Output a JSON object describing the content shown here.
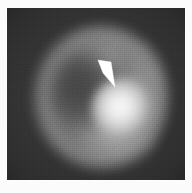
{
  "figure": {
    "kind": "grayscale-scan-image",
    "modality_appearance": "nuclear-medicine-scintigram",
    "background_color": "#363636",
    "paper_color": "#fbfbfb",
    "frame": {
      "left": 7,
      "top": 8,
      "width": 178,
      "height": 172,
      "border_color": "#ffffff"
    },
    "ghost_text": ""
  },
  "scan": {
    "field_label": "",
    "features": [
      {
        "name": "uptake-halo",
        "description": "broad diffuse halo of tracer uptake forming a rounded organ silhouette",
        "center_x": 93,
        "center_y": 89,
        "radius_x": 67,
        "radius_y": 71,
        "peak_gray": "#cdcdcd"
      },
      {
        "name": "uptake-ring",
        "description": "bright crescent rim of activity around the periphery",
        "center_x": 94,
        "center_y": 89,
        "peak_gray": "#cdcdcd"
      },
      {
        "name": "cold-center",
        "description": "darker photopenic interior left of centre",
        "center_x": 77,
        "center_y": 83,
        "peak_gray": "#282828"
      },
      {
        "name": "focal-hotspot",
        "description": "intense focal accumulation indicated by the arrow",
        "center_x": 115,
        "center_y": 101,
        "peak_gray": "#fcfcfc"
      },
      {
        "name": "lower-arc",
        "description": "diffuse activity along the inferior arc",
        "center_x": 105,
        "center_y": 134,
        "peak_gray": "#c8c8c8"
      },
      {
        "name": "upper-arc",
        "description": "activity along the superior rim",
        "center_x": 100,
        "center_y": 44,
        "peak_gray": "#bababa"
      },
      {
        "name": "right-arc",
        "description": "activity along the right lateral rim",
        "center_x": 138,
        "center_y": 88,
        "peak_gray": "#c4c4c4"
      }
    ]
  },
  "annotation": {
    "arrow": {
      "name": "pointer-arrow",
      "color": "#ffffff",
      "style": "solid filled tapering wedge",
      "direction": "down-right",
      "tail_x": 92,
      "tail_y": 52,
      "tip_x": 107,
      "tip_y": 79,
      "points": "91,52 104,54 108,79 96,65",
      "label": "",
      "points_to_feature": "focal-hotspot"
    }
  }
}
